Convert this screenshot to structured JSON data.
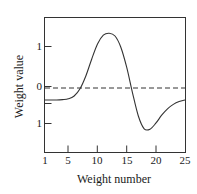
{
  "chart_data": {
    "type": "line",
    "title": "",
    "xlabel": "Weight number",
    "ylabel": "Weight value",
    "xlim": [
      1,
      25
    ],
    "ylim": [
      -1.6,
      1.75
    ],
    "grid": false,
    "legend": null,
    "x_ticks": [
      1,
      5,
      10,
      15,
      20,
      25
    ],
    "x_tick_labels": [
      "1",
      "5",
      "10",
      "15",
      "20",
      "25"
    ],
    "y_ticks": [
      1,
      0,
      -1
    ],
    "y_tick_labels": [
      "1",
      "0",
      "1"
    ],
    "annotations": [
      {
        "name": "zero-reference-line",
        "type": "hline",
        "y": 0,
        "style": "dashed"
      }
    ],
    "series": [
      {
        "name": "weight value",
        "style": "solid",
        "color": "#333333",
        "x": [
          1,
          2,
          3,
          4,
          5,
          6,
          7,
          8,
          9,
          10,
          11,
          12,
          13,
          14,
          15,
          16,
          17,
          18,
          19,
          20,
          21,
          22,
          23,
          24,
          25
        ],
        "values": [
          -0.3,
          -0.3,
          -0.3,
          -0.29,
          -0.27,
          -0.2,
          -0.02,
          0.3,
          0.72,
          1.1,
          1.32,
          1.37,
          1.3,
          1.02,
          0.52,
          -0.12,
          -0.7,
          -1.02,
          -1.03,
          -0.88,
          -0.68,
          -0.52,
          -0.41,
          -0.34,
          -0.3
        ]
      }
    ]
  },
  "axes": {
    "frame_color": "#333333",
    "curve_color": "#333333",
    "zero_line_color": "#333333"
  }
}
